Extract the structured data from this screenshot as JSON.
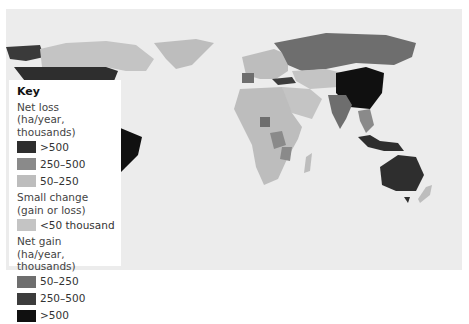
{
  "key": {
    "title": "Key",
    "groups": [
      {
        "label_line1": "Net loss",
        "label_line2": "(ha/year, thousands)",
        "items": [
          {
            "label": ">500",
            "color": "#2e2e2e"
          },
          {
            "label": "250–500",
            "color": "#8a8a8a"
          },
          {
            "label": "50–250",
            "color": "#bdbdbd"
          }
        ]
      },
      {
        "label_line1": "Small change",
        "label_line2": "(gain or loss)",
        "items": [
          {
            "label": "<50 thousand",
            "color": "#c4c4c4"
          }
        ]
      },
      {
        "label_line1": "Net gain",
        "label_line2": "(ha/year, thousands)",
        "items": [
          {
            "label": "50–250",
            "color": "#6e6e6e"
          },
          {
            "label": "250–500",
            "color": "#3c3c3c"
          },
          {
            "label": ">500",
            "color": "#101010"
          }
        ]
      }
    ]
  },
  "map": {
    "ocean_color": "#ececec",
    "regions": {
      "usa": "net-loss->500",
      "canada": "small-change",
      "brazil": "net-loss->500",
      "china": "net-gain->500",
      "australia": "net-loss->500",
      "russia": "net-gain-50-250",
      "india": "net-gain-50-250",
      "africa_general": "net-loss-50-250"
    }
  }
}
